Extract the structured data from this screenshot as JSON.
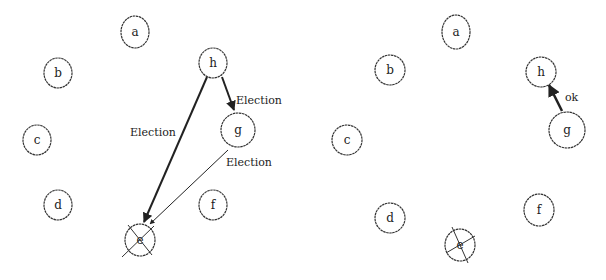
{
  "colors": {
    "stroke": "#333333",
    "arrow": "#222222",
    "background": "#ffffff"
  },
  "panels": [
    {
      "name": "left",
      "nodes": [
        {
          "id": "a",
          "label": "a",
          "x": 135,
          "y": 32,
          "rx": 14,
          "ry": 16,
          "crossed": false
        },
        {
          "id": "b",
          "label": "b",
          "x": 58,
          "y": 73,
          "rx": 14,
          "ry": 15,
          "crossed": false
        },
        {
          "id": "c",
          "label": "c",
          "x": 37,
          "y": 140,
          "rx": 14,
          "ry": 15,
          "crossed": false
        },
        {
          "id": "d",
          "label": "d",
          "x": 58,
          "y": 205,
          "rx": 14,
          "ry": 15,
          "crossed": false
        },
        {
          "id": "e",
          "label": "e",
          "x": 140,
          "y": 240,
          "rx": 15,
          "ry": 16,
          "crossed": true
        },
        {
          "id": "f",
          "label": "f",
          "x": 213,
          "y": 205,
          "rx": 14,
          "ry": 15,
          "crossed": false
        },
        {
          "id": "g",
          "label": "g",
          "x": 238,
          "y": 130,
          "rx": 17,
          "ry": 17,
          "crossed": false
        },
        {
          "id": "h",
          "label": "h",
          "x": 213,
          "y": 63,
          "rx": 14,
          "ry": 15,
          "crossed": false
        }
      ],
      "edges": [
        {
          "from": "h",
          "to": "e",
          "label": "Election",
          "x1": 207,
          "y1": 77,
          "x2": 144,
          "y2": 222,
          "lx": 130,
          "ly": 136,
          "width": 2
        },
        {
          "from": "h",
          "to": "g",
          "label": "Election",
          "x1": 222,
          "y1": 77,
          "x2": 234,
          "y2": 110,
          "lx": 236,
          "ly": 104,
          "width": 2
        },
        {
          "from": "g",
          "to": "e",
          "label": "Election",
          "x1": 228,
          "y1": 150,
          "x2": 150,
          "y2": 224,
          "lx": 226,
          "ly": 166,
          "width": 1
        }
      ]
    },
    {
      "name": "right",
      "nodes": [
        {
          "id": "a",
          "label": "a",
          "x": 456,
          "y": 32,
          "rx": 14,
          "ry": 17,
          "crossed": false
        },
        {
          "id": "b",
          "label": "b",
          "x": 390,
          "y": 70,
          "rx": 15,
          "ry": 15,
          "crossed": false
        },
        {
          "id": "c",
          "label": "c",
          "x": 347,
          "y": 140,
          "rx": 15,
          "ry": 15,
          "crossed": false
        },
        {
          "id": "d",
          "label": "d",
          "x": 390,
          "y": 218,
          "rx": 15,
          "ry": 15,
          "crossed": false
        },
        {
          "id": "e",
          "label": "e",
          "x": 460,
          "y": 245,
          "rx": 15,
          "ry": 16,
          "crossed": true
        },
        {
          "id": "f",
          "label": "f",
          "x": 539,
          "y": 210,
          "rx": 15,
          "ry": 16,
          "crossed": false
        },
        {
          "id": "g",
          "label": "g",
          "x": 567,
          "y": 130,
          "rx": 18,
          "ry": 18,
          "crossed": false
        },
        {
          "id": "h",
          "label": "h",
          "x": 541,
          "y": 72,
          "rx": 15,
          "ry": 15,
          "crossed": false
        }
      ],
      "edges": [
        {
          "from": "g",
          "to": "h",
          "label": "ok",
          "x1": 562,
          "y1": 111,
          "x2": 549,
          "y2": 85,
          "lx": 565,
          "ly": 101,
          "width": 2.5
        }
      ]
    }
  ]
}
